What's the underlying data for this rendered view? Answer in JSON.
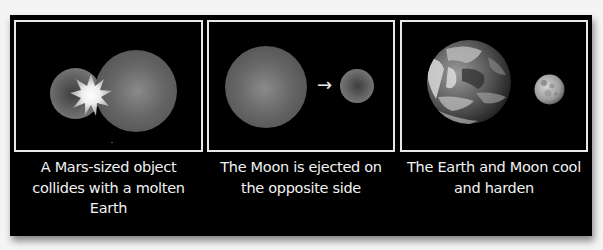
{
  "diagram": {
    "background_color": "#000000",
    "frame_color": "#e8e8e8",
    "panels": [
      {
        "step": 1,
        "caption_lines": [
          "A Mars-sized object",
          "collides with a molten",
          "Earth"
        ],
        "elements": [
          "impactor-sphere",
          "impact-starburst",
          "molten-earth-sphere"
        ]
      },
      {
        "step": 2,
        "caption_lines": [
          "The Moon is ejected on",
          "the opposite side"
        ],
        "arrow_glyph": "→",
        "elements": [
          "earth-sphere",
          "ejection-arrow",
          "moon-sphere"
        ]
      },
      {
        "step": 3,
        "caption_lines": [
          "The Earth and Moon cool",
          "and harden"
        ],
        "elements": [
          "earth-globe",
          "moon-globe"
        ]
      }
    ]
  }
}
